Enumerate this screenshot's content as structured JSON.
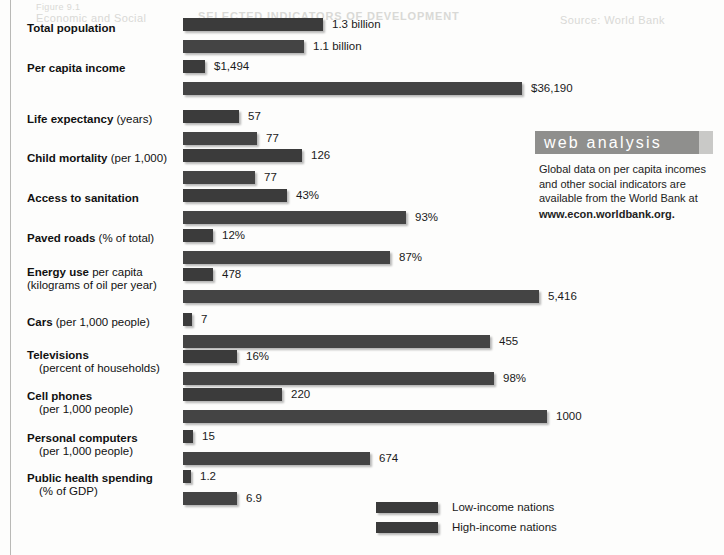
{
  "page": {
    "ghost_text": {
      "line1": "Figure 9.1",
      "line2": "Economic and Social",
      "line3": "SELECTED INDICATORS OF DEVELOPMENT",
      "line4": "Source: World Bank"
    }
  },
  "chart_data": {
    "type": "bar",
    "orientation": "horizontal",
    "title": "",
    "xlabel": "",
    "ylabel": "",
    "grid": false,
    "legend_position": "bottom-center",
    "series": [
      {
        "name": "Low-income nations",
        "color": "#3b3b3b"
      },
      {
        "name": "High-income nations",
        "color": "#3b3b3b"
      }
    ],
    "categories": [
      {
        "label_bold": "Total population",
        "label_normal": "",
        "label_line2": "",
        "low": {
          "display": "1.3 billion",
          "value": 1.3,
          "unit": "billion"
        },
        "high": {
          "display": "1.1 billion",
          "value": 1.1,
          "unit": "billion"
        }
      },
      {
        "label_bold": "Per capita income",
        "label_normal": "",
        "label_line2": "",
        "low": {
          "display": "$1,494",
          "value": 1494,
          "unit": "US$"
        },
        "high": {
          "display": "$36,190",
          "value": 36190,
          "unit": "US$"
        }
      },
      {
        "label_bold": "Life expectancy",
        "label_normal": " (years)",
        "label_line2": "",
        "low": {
          "display": "57",
          "value": 57,
          "unit": "years"
        },
        "high": {
          "display": "77",
          "value": 77,
          "unit": "years"
        }
      },
      {
        "label_bold": "Child mortality",
        "label_normal": " (per 1,000)",
        "label_line2": "",
        "low": {
          "display": "126",
          "value": 126,
          "unit": "per 1,000"
        },
        "high": {
          "display": "77",
          "value": 77,
          "unit": "per 1,000"
        }
      },
      {
        "label_bold": "Access to sanitation",
        "label_normal": "",
        "label_line2": "",
        "low": {
          "display": "43%",
          "value": 43,
          "unit": "%"
        },
        "high": {
          "display": "93%",
          "value": 93,
          "unit": "%"
        }
      },
      {
        "label_bold": "Paved roads",
        "label_normal": " (% of total)",
        "label_line2": "",
        "low": {
          "display": "12%",
          "value": 12,
          "unit": "%"
        },
        "high": {
          "display": "87%",
          "value": 87,
          "unit": "%"
        }
      },
      {
        "label_bold": "Energy use",
        "label_normal": " per capita",
        "label_line2": "(kilograms of oil per year)",
        "label_line2_indent": false,
        "low": {
          "display": "478",
          "value": 478,
          "unit": "kg oil/yr"
        },
        "high": {
          "display": "5,416",
          "value": 5416,
          "unit": "kg oil/yr"
        }
      },
      {
        "label_bold": "Cars",
        "label_normal": " (per 1,000 people)",
        "label_line2": "",
        "low": {
          "display": "7",
          "value": 7,
          "unit": "per 1,000"
        },
        "high": {
          "display": "455",
          "value": 455,
          "unit": "per 1,000"
        }
      },
      {
        "label_bold": "Televisions",
        "label_normal": "",
        "label_line2": "(percent of households)",
        "label_line2_indent": true,
        "low": {
          "display": "16%",
          "value": 16,
          "unit": "%"
        },
        "high": {
          "display": "98%",
          "value": 98,
          "unit": "%"
        }
      },
      {
        "label_bold": "Cell phones",
        "label_normal": "",
        "label_line2": "(per 1,000 people)",
        "label_line2_indent": true,
        "low": {
          "display": "220",
          "value": 220,
          "unit": "per 1,000"
        },
        "high": {
          "display": "1000",
          "value": 1000,
          "unit": "per 1,000"
        }
      },
      {
        "label_bold": "Personal computers",
        "label_normal": "",
        "label_line2": "(per 1,000 people)",
        "label_line2_indent": true,
        "low": {
          "display": "15",
          "value": 15,
          "unit": "per 1,000"
        },
        "high": {
          "display": "674",
          "value": 674,
          "unit": "per 1,000"
        }
      },
      {
        "label_bold": "Public health spending",
        "label_normal": "",
        "label_line2": "(% of GDP)",
        "label_line2_indent": true,
        "low": {
          "display": "1.2",
          "value": 1.2,
          "unit": "% of GDP"
        },
        "high": {
          "display": "6.9",
          "value": 6.9,
          "unit": "% of GDP"
        }
      }
    ]
  },
  "legend": {
    "items": [
      {
        "label": "Low-income nations"
      },
      {
        "label": "High-income nations"
      }
    ]
  },
  "web_analysis": {
    "heading": "web analysis",
    "body": "Global data on per capita incomes and other social indicators are available from the World Bank at",
    "url": "www.econ.worldbank.org."
  }
}
